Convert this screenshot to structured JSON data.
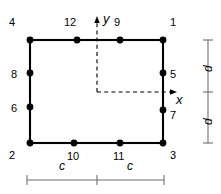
{
  "figure": {
    "type": "structural-element-node-diagram"
  },
  "geometry": {
    "rect": {
      "left": 30,
      "top": 40,
      "right": 163,
      "bottom": 143
    },
    "origin": {
      "x": 163,
      "y": 92
    },
    "units": "px"
  },
  "nodes": [
    {
      "id": "1",
      "label": "1",
      "cx": 163,
      "cy": 40,
      "label_x": 170,
      "label_y": 17
    },
    {
      "id": "2",
      "label": "2",
      "cx": 30,
      "cy": 143,
      "label_x": 9,
      "label_y": 150
    },
    {
      "id": "3",
      "label": "3",
      "cx": 163,
      "cy": 143,
      "label_x": 170,
      "label_y": 150
    },
    {
      "id": "4",
      "label": "4",
      "cx": 30,
      "cy": 40,
      "label_x": 9,
      "label_y": 17
    },
    {
      "id": "5",
      "label": "5",
      "cx": 163,
      "cy": 73,
      "label_x": 170,
      "label_y": 69
    },
    {
      "id": "6",
      "label": "6",
      "cx": 30,
      "cy": 107,
      "label_x": 11,
      "label_y": 103
    },
    {
      "id": "7",
      "label": "7",
      "cx": 163,
      "cy": 110,
      "label_x": 170,
      "label_y": 110
    },
    {
      "id": "8",
      "label": "8",
      "cx": 30,
      "cy": 73,
      "label_x": 11,
      "label_y": 69
    },
    {
      "id": "9",
      "label": "9",
      "cx": 120,
      "cy": 40,
      "label_x": 114,
      "label_y": 17
    },
    {
      "id": "10",
      "label": "10",
      "cx": 74,
      "cy": 143,
      "label_x": 68,
      "label_y": 151
    },
    {
      "id": "11",
      "label": "11",
      "cx": 120,
      "cy": 143,
      "label_x": 114,
      "label_y": 151
    },
    {
      "id": "12",
      "label": "12",
      "cx": 77,
      "cy": 40,
      "label_x": 65,
      "label_y": 17
    }
  ],
  "axes": {
    "x": {
      "label": "x",
      "label_x": 176,
      "label_y": 94,
      "from_x": 97,
      "to_x": 177,
      "y": 92
    },
    "y": {
      "label": "y",
      "label_x": 103,
      "label_y": 14,
      "from_y": 92,
      "to_y": 20,
      "x": 97
    }
  },
  "dimensions": [
    {
      "name": "c-left",
      "label": "c",
      "label_x": 61,
      "label_y": 162,
      "orientation": "horizontal"
    },
    {
      "name": "c-right",
      "label": "c",
      "label_x": 128,
      "label_y": 162,
      "orientation": "horizontal"
    },
    {
      "name": "d-top",
      "label": "d",
      "label_x": 203,
      "label_y": 72,
      "orientation": "vertical"
    },
    {
      "name": "d-bottom",
      "label": "d",
      "label_x": 203,
      "label_y": 125,
      "orientation": "vertical"
    }
  ],
  "dimension_lines": {
    "horizontal": {
      "y": 180,
      "x_start": 27,
      "x_mid": 97,
      "x_end": 164,
      "tick_half": 5
    },
    "vertical": {
      "x": 208,
      "y_start": 40,
      "y_mid": 92,
      "y_end": 143,
      "tick_half": 5
    }
  },
  "colors": {
    "stroke": "#000000",
    "dimension_stroke": "#6e6e6e",
    "node_fill": "#000000",
    "background": "#ffffff"
  }
}
